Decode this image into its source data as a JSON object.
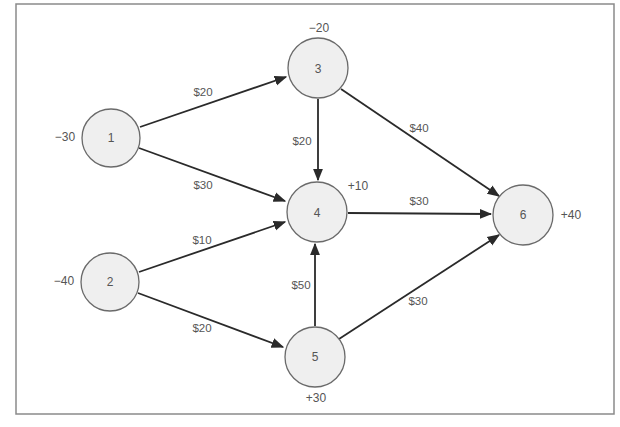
{
  "diagram": {
    "type": "network-flow",
    "nodes": [
      {
        "id": "1",
        "label": "1",
        "supply": "−30",
        "x": 111,
        "y": 138
      },
      {
        "id": "2",
        "label": "2",
        "supply": "−40",
        "x": 110,
        "y": 282
      },
      {
        "id": "3",
        "label": "3",
        "supply": "−20",
        "x": 318,
        "y": 68
      },
      {
        "id": "4",
        "label": "4",
        "supply": "+10",
        "x": 317,
        "y": 212
      },
      {
        "id": "5",
        "label": "5",
        "supply": "+30",
        "x": 315,
        "y": 357
      },
      {
        "id": "6",
        "label": "6",
        "supply": "+40",
        "x": 523,
        "y": 215
      }
    ],
    "edges": [
      {
        "from": "1",
        "to": "3",
        "cost": "$20"
      },
      {
        "from": "1",
        "to": "4",
        "cost": "$30"
      },
      {
        "from": "2",
        "to": "4",
        "cost": "$10"
      },
      {
        "from": "2",
        "to": "5",
        "cost": "$20"
      },
      {
        "from": "3",
        "to": "4",
        "cost": "$20"
      },
      {
        "from": "3",
        "to": "6",
        "cost": "$40"
      },
      {
        "from": "4",
        "to": "6",
        "cost": "$30"
      },
      {
        "from": "5",
        "to": "4",
        "cost": "$50"
      },
      {
        "from": "5",
        "to": "6",
        "cost": "$30"
      }
    ]
  }
}
